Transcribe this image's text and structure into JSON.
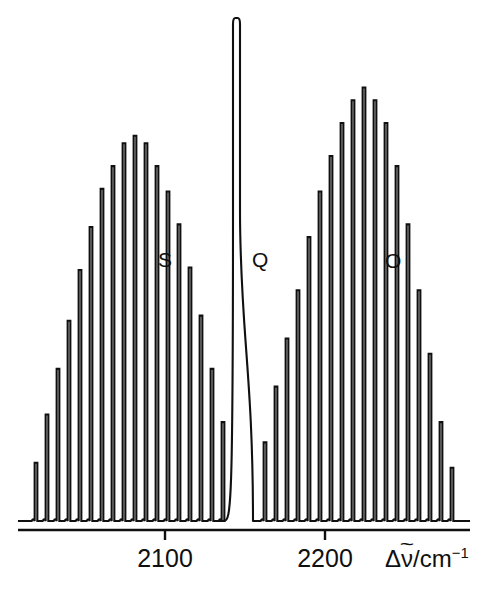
{
  "figure": {
    "kind": "rotational-raman-spectrum",
    "background_color": "#ffffff",
    "trace_color": "#101010"
  },
  "axis": {
    "title_delta": "Δ",
    "title_nu": "ν",
    "title_tilde": "~",
    "title_unit": "/cm",
    "title_exponent": "−1",
    "title_full": "Δν̃/cm⁻¹",
    "ticks": [
      {
        "label": "2100",
        "value": 2100,
        "x_px": 165
      },
      {
        "label": "2200",
        "value": 2200,
        "x_px": 325
      }
    ],
    "baseline_y_px": 521,
    "axis_line_y_px": 530,
    "axis_x_start_px": 18,
    "axis_x_end_px": 470,
    "tick_length_px": 10
  },
  "branch_labels": [
    {
      "name": "S",
      "text": "S",
      "x_px": 158,
      "y_px": 249
    },
    {
      "name": "Q",
      "text": "Q",
      "x_px": 252,
      "y_px": 249
    },
    {
      "name": "O",
      "text": "O",
      "x_px": 385,
      "y_px": 250
    }
  ],
  "chart_data": {
    "type": "line",
    "title": "",
    "subtitle": "",
    "xlabel": "Δν̃/cm⁻¹",
    "ylabel": "",
    "xlim": [
      2035,
      2250
    ],
    "ylim": [
      0,
      1
    ],
    "grid": false,
    "legend": "none",
    "annotations": [
      "S",
      "Q",
      "O"
    ],
    "xtick_labels": [
      "2100",
      "2200"
    ],
    "xtick_values": [
      2100,
      2200
    ],
    "series": [
      {
        "name": "S-branch",
        "label": "S",
        "comment": "Lower-wavenumber branch; line x positions in px and heights as fraction of plot height",
        "lines": [
          {
            "x_px": 36,
            "h": 0.115
          },
          {
            "x_px": 47,
            "h": 0.21
          },
          {
            "x_px": 58,
            "h": 0.3
          },
          {
            "x_px": 69,
            "h": 0.395
          },
          {
            "x_px": 80,
            "h": 0.495
          },
          {
            "x_px": 91,
            "h": 0.58
          },
          {
            "x_px": 102,
            "h": 0.655
          },
          {
            "x_px": 113,
            "h": 0.7
          },
          {
            "x_px": 124,
            "h": 0.745
          },
          {
            "x_px": 135,
            "h": 0.76
          },
          {
            "x_px": 146,
            "h": 0.745
          },
          {
            "x_px": 157,
            "h": 0.7
          },
          {
            "x_px": 168,
            "h": 0.65
          },
          {
            "x_px": 179,
            "h": 0.585
          },
          {
            "x_px": 190,
            "h": 0.5
          },
          {
            "x_px": 201,
            "h": 0.405
          },
          {
            "x_px": 212,
            "h": 0.3
          },
          {
            "x_px": 223,
            "h": 0.195
          }
        ]
      },
      {
        "name": "Q-branch",
        "label": "Q",
        "comment": "Single intense broad central band, clipped at top of frame",
        "center_x_px": 243,
        "width_px": 20,
        "height_fraction": 1.0,
        "spike_top_y_px": 18
      },
      {
        "name": "O-branch",
        "label": "O",
        "comment": "Higher-wavenumber branch; taller envelope than S-branch",
        "lines": [
          {
            "x_px": 265,
            "h": 0.155
          },
          {
            "x_px": 276,
            "h": 0.265
          },
          {
            "x_px": 287,
            "h": 0.36
          },
          {
            "x_px": 298,
            "h": 0.455
          },
          {
            "x_px": 309,
            "h": 0.56
          },
          {
            "x_px": 320,
            "h": 0.65
          },
          {
            "x_px": 331,
            "h": 0.72
          },
          {
            "x_px": 342,
            "h": 0.785
          },
          {
            "x_px": 353,
            "h": 0.83
          },
          {
            "x_px": 364,
            "h": 0.855
          },
          {
            "x_px": 375,
            "h": 0.83
          },
          {
            "x_px": 386,
            "h": 0.785
          },
          {
            "x_px": 397,
            "h": 0.7
          },
          {
            "x_px": 408,
            "h": 0.585
          },
          {
            "x_px": 419,
            "h": 0.455
          },
          {
            "x_px": 430,
            "h": 0.33
          },
          {
            "x_px": 441,
            "h": 0.195
          },
          {
            "x_px": 452,
            "h": 0.105
          }
        ]
      }
    ]
  }
}
